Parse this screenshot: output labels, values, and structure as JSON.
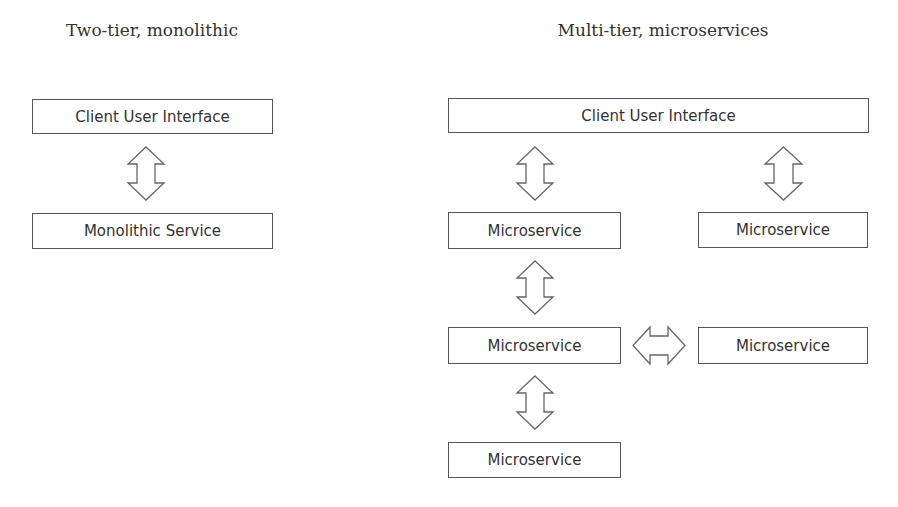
{
  "left": {
    "title": "Two-tier, monolithic",
    "boxes": [
      "Client User Interface",
      "Monolithic Service"
    ]
  },
  "right": {
    "title": "Multi-tier, microservices",
    "top_box": "Client User Interface",
    "boxes": [
      "Microservice",
      "Microservice",
      "Microservice",
      "Microservice",
      "Microservice"
    ]
  },
  "arrows": {
    "type": "double-headed block arrow",
    "count_vertical": 5,
    "count_horizontal": 1
  }
}
